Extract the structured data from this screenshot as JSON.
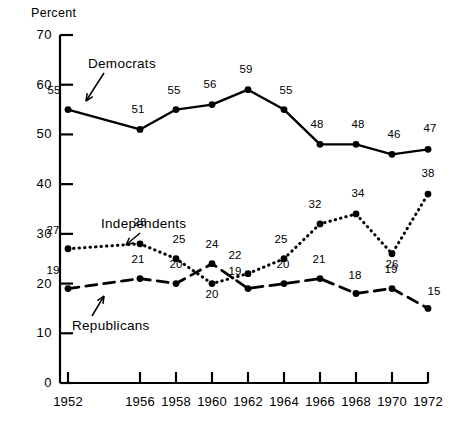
{
  "chart_data": {
    "type": "line",
    "title": "",
    "xlabel": "",
    "ylabel": "Percent",
    "ylim": [
      0,
      70
    ],
    "ytick_values": [
      0,
      10,
      20,
      30,
      40,
      50,
      60,
      70
    ],
    "ytick_labels": [
      "0",
      "10",
      "20",
      "30",
      "40",
      "50",
      "60",
      "70"
    ],
    "grid": false,
    "legend_position": "inline-annotations",
    "categories": [
      "1952",
      "1956",
      "1958",
      "1960",
      "1962",
      "1964",
      "1966",
      "1968",
      "1970",
      "1972"
    ],
    "x": [
      1952,
      1956,
      1958,
      1960,
      1962,
      1964,
      1966,
      1968,
      1970,
      1972
    ],
    "series": [
      {
        "name": "Democrats",
        "style": "solid",
        "values": [
          55,
          51,
          55,
          56,
          59,
          55,
          48,
          48,
          46,
          47
        ],
        "labels": [
          "55",
          "51",
          "55",
          "56",
          "59",
          "55",
          "48",
          "48",
          "46",
          "47"
        ]
      },
      {
        "name": "Independents",
        "style": "dotted",
        "values": [
          27,
          28,
          25,
          20,
          22,
          25,
          32,
          34,
          26,
          38
        ],
        "labels": [
          "27",
          "28",
          "25",
          "20",
          "22",
          "25",
          "32",
          "34",
          "26",
          "38"
        ]
      },
      {
        "name": "Republicans",
        "style": "dashed",
        "values": [
          19,
          21,
          20,
          24,
          19,
          20,
          21,
          18,
          19,
          15
        ],
        "labels": [
          "19",
          "21",
          "20",
          "24",
          "19",
          "20",
          "21",
          "18",
          "19",
          "15"
        ]
      }
    ],
    "annotations": [
      {
        "text": "Democrats",
        "points_to": "democrats-line"
      },
      {
        "text": "Independents",
        "points_to": "independents-line"
      },
      {
        "text": "Republicans",
        "points_to": "republicans-line"
      }
    ],
    "colors": {
      "ink": "#000000",
      "background": "#ffffff"
    }
  }
}
